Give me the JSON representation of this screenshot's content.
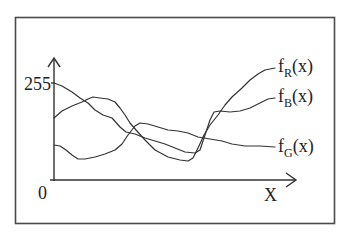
{
  "diagram": {
    "type": "function-plot",
    "y_axis": {
      "max_label": "255",
      "origin_label": "0"
    },
    "x_axis": {
      "label": "X"
    },
    "curves": [
      {
        "id": "fR",
        "func": "f",
        "subscript": "R",
        "arg": "(x)",
        "points": [
          [
            54,
            118
          ],
          [
            62,
            111
          ],
          [
            72,
            106
          ],
          [
            82,
            102
          ],
          [
            88,
            99
          ],
          [
            93,
            97
          ],
          [
            100,
            98
          ],
          [
            108,
            99
          ],
          [
            115,
            102
          ],
          [
            120,
            108
          ],
          [
            125,
            115
          ],
          [
            130,
            123
          ],
          [
            136,
            130
          ],
          [
            145,
            140
          ],
          [
            155,
            150
          ],
          [
            168,
            157
          ],
          [
            180,
            160
          ],
          [
            188,
            161
          ],
          [
            193,
            158
          ],
          [
            198,
            148
          ],
          [
            204,
            135
          ],
          [
            210,
            125
          ],
          [
            218,
            115
          ],
          [
            225,
            105
          ],
          [
            232,
            97
          ],
          [
            242,
            88
          ],
          [
            250,
            80
          ],
          [
            258,
            74
          ],
          [
            265,
            70
          ],
          [
            275,
            68
          ]
        ]
      },
      {
        "id": "fB",
        "func": "f",
        "subscript": "B",
        "arg": "(x)",
        "points": [
          [
            54,
            83
          ],
          [
            62,
            86
          ],
          [
            72,
            92
          ],
          [
            80,
            98
          ],
          [
            88,
            103
          ],
          [
            95,
            110
          ],
          [
            103,
            115
          ],
          [
            112,
            118
          ],
          [
            120,
            127
          ],
          [
            126,
            132
          ],
          [
            135,
            134
          ],
          [
            145,
            138
          ],
          [
            155,
            141
          ],
          [
            165,
            144
          ],
          [
            175,
            148
          ],
          [
            185,
            152
          ],
          [
            195,
            153
          ],
          [
            200,
            150
          ],
          [
            205,
            135
          ],
          [
            210,
            120
          ],
          [
            214,
            112
          ],
          [
            220,
            111
          ],
          [
            230,
            112
          ],
          [
            240,
            111
          ],
          [
            250,
            108
          ],
          [
            260,
            103
          ],
          [
            268,
            99
          ],
          [
            275,
            98
          ]
        ]
      },
      {
        "id": "fG",
        "func": "f",
        "subscript": "G",
        "arg": "(x)",
        "points": [
          [
            54,
            145
          ],
          [
            60,
            146
          ],
          [
            66,
            150
          ],
          [
            72,
            155
          ],
          [
            78,
            159
          ],
          [
            85,
            159
          ],
          [
            95,
            157
          ],
          [
            105,
            154
          ],
          [
            115,
            150
          ],
          [
            122,
            144
          ],
          [
            128,
            135
          ],
          [
            135,
            126
          ],
          [
            140,
            123
          ],
          [
            148,
            124
          ],
          [
            158,
            127
          ],
          [
            168,
            130
          ],
          [
            178,
            131
          ],
          [
            188,
            133
          ],
          [
            198,
            137
          ],
          [
            210,
            139
          ],
          [
            222,
            141
          ],
          [
            232,
            144
          ],
          [
            245,
            146
          ],
          [
            260,
            146
          ],
          [
            275,
            147
          ]
        ]
      }
    ]
  }
}
